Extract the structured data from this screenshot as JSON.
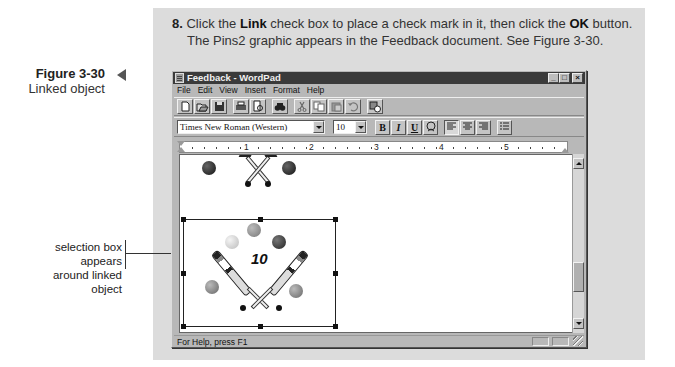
{
  "step": {
    "number": "8.",
    "text_before_link": "Click the ",
    "link_label": "Link",
    "text_middle": " check box to place a check mark in it, then click the ",
    "ok_label": "OK",
    "text_after_ok": " button.",
    "line2": "The Pins2 graphic appears in the Feedback document. See Figure 3-30."
  },
  "figure": {
    "number": "Figure 3-30",
    "title": "Linked object"
  },
  "callout": {
    "line1": "selection box appears",
    "line2": "around linked object"
  },
  "window": {
    "title": "Feedback - WordPad",
    "controls": {
      "minimize": "_",
      "maximize": "□",
      "close": "×"
    },
    "menu": [
      {
        "label": "File",
        "accel": "F"
      },
      {
        "label": "Edit",
        "accel": "E"
      },
      {
        "label": "View",
        "accel": "V"
      },
      {
        "label": "Insert",
        "accel": "I"
      },
      {
        "label": "Format",
        "accel": "o"
      },
      {
        "label": "Help",
        "accel": "H"
      }
    ],
    "toolbar": [
      {
        "name": "new-icon",
        "glyph": "🗋"
      },
      {
        "name": "open-icon",
        "glyph": "📂"
      },
      {
        "name": "save-icon",
        "glyph": "💾"
      },
      {
        "name": "print-icon",
        "glyph": "🖶"
      },
      {
        "name": "print-preview-icon",
        "glyph": "🔍"
      },
      {
        "name": "find-icon",
        "glyph": "🔭"
      },
      {
        "name": "cut-icon",
        "glyph": "✂"
      },
      {
        "name": "copy-icon",
        "glyph": "⧉"
      },
      {
        "name": "paste-icon",
        "glyph": "📋"
      },
      {
        "name": "undo-icon",
        "glyph": "↶"
      },
      {
        "name": "insert-datetime-icon",
        "glyph": "🕒"
      }
    ],
    "format": {
      "font": "Times New Roman (Western)",
      "size": "10",
      "bold": "B",
      "italic": "I",
      "underline": "U",
      "color": "🎨",
      "align_left": "≡",
      "align_center": "≡",
      "align_right": "≡",
      "bullets": "☰"
    },
    "ruler": {
      "numbers": [
        "1",
        "2",
        "3",
        "4",
        "5"
      ]
    },
    "status": "For Help, press F1",
    "graphic": {
      "label": "10"
    }
  }
}
